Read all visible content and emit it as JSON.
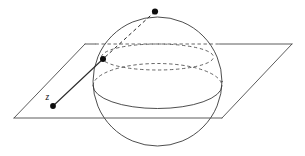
{
  "figure": {
    "type": "geometry-diagram",
    "canvas": {
      "width": 305,
      "height": 156,
      "background": "#ffffff"
    },
    "colors": {
      "outline": "#3a3a3a",
      "plane": "#4a4a4a",
      "hidden": "#4a4a4a",
      "ray": "#2b2b2b",
      "dot": "#0d0d0d",
      "label": "#111111"
    },
    "labels": [
      {
        "name": "point-z-label",
        "text": "z",
        "x": 45.5,
        "y": 99.5
      }
    ],
    "points": [
      {
        "name": "north-pole-point",
        "label": "",
        "x": 155.0,
        "y": 11.5,
        "r": 3.1
      },
      {
        "name": "sphere-surface-point",
        "label": "",
        "x": 103.0,
        "y": 59.0,
        "r": 3.0
      },
      {
        "name": "plane-point-z",
        "label": "z",
        "x": 53.0,
        "y": 106.0,
        "r": 2.9
      }
    ],
    "sphere": {
      "name": "riemann-sphere",
      "center_x": 157.5,
      "center_y": 81.5,
      "radius": 64.5
    },
    "equator": {
      "name": "equator-ellipse",
      "center_x": 157.5,
      "center_y": 86.0,
      "rx": 64.5,
      "ry": 22.5
    },
    "upper_circle": {
      "name": "plane-intersection-circle",
      "center_x": 157.5,
      "center_y": 57.0,
      "rx": 56.0,
      "ry": 13.0
    },
    "plane": {
      "name": "complex-plane",
      "corners": [
        {
          "x": 85.0,
          "y": 44.0
        },
        {
          "x": 292.0,
          "y": 44.0
        },
        {
          "x": 222.0,
          "y": 118.0
        },
        {
          "x": 14.0,
          "y": 118.0
        }
      ]
    },
    "ray": {
      "name": "projection-ray",
      "from_label": "north-pole",
      "to_label": "z",
      "hidden_segment": {
        "x1": 155.0,
        "y1": 11.5,
        "x2": 103.0,
        "y2": 59.0
      },
      "visible_segment": {
        "x1": 103.0,
        "y1": 59.0,
        "x2": 53.0,
        "y2": 106.0
      }
    }
  }
}
